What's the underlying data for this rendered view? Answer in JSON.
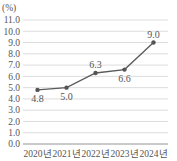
{
  "chart_data": {
    "type": "line",
    "title": "",
    "unit_label": "(%)",
    "xlabel": "",
    "ylabel": "(%)",
    "categories": [
      "2020년",
      "2021년",
      "2022년",
      "2023년",
      "2024년"
    ],
    "series": [
      {
        "name": "",
        "values": [
          4.8,
          5.0,
          6.3,
          6.6,
          9.0
        ],
        "color": "#5a5a5a"
      }
    ],
    "data_labels": [
      "4.8",
      "5.0",
      "6.3",
      "6.6",
      "9.0"
    ],
    "yticks": [
      "0.0",
      "1.0",
      "2.0",
      "3.0",
      "4.0",
      "5.0",
      "6.0",
      "7.0",
      "8.0",
      "9.0",
      "10.0",
      "11.0"
    ],
    "ylim": [
      0,
      11
    ],
    "grid": true,
    "legend": "none"
  }
}
